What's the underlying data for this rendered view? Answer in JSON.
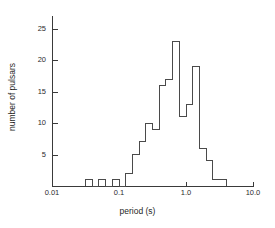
{
  "chart_data": {
    "type": "bar",
    "title": "",
    "subtitle": "",
    "xlabel": "period (s)",
    "ylabel": "number of pulsars",
    "xscale": "log",
    "yscale": "linear",
    "xlim": [
      0.01,
      10.0
    ],
    "ylim": [
      0,
      27
    ],
    "grid": false,
    "legend": null,
    "x_tick_labels": [
      "0.01",
      "0.1",
      "1.0",
      "10.0"
    ],
    "x_tick_values": [
      0.01,
      0.1,
      1.0,
      10.0
    ],
    "y_tick_labels": [
      "5",
      "10",
      "15",
      "20",
      "25"
    ],
    "y_tick_values": [
      5,
      10,
      15,
      20,
      25
    ],
    "bin_width_dex": 0.1,
    "bin_left_edges": [
      0.0316,
      0.0501,
      0.0794,
      0.1259,
      0.1585,
      0.1995,
      0.2512,
      0.3162,
      0.3981,
      0.5012,
      0.631,
      0.7943,
      1.0,
      1.2589,
      1.5849,
      1.9953,
      2.5119,
      3.1623
    ],
    "bin_right_edges": [
      0.0398,
      0.0631,
      0.1,
      0.1585,
      0.1995,
      0.2512,
      0.3162,
      0.3981,
      0.5012,
      0.631,
      0.7943,
      1.0,
      1.2589,
      1.5849,
      1.9953,
      2.5119,
      3.1623,
      3.9811
    ],
    "categories": [
      "0.032-0.040",
      "0.050-0.063",
      "0.079-0.100",
      "0.126-0.158",
      "0.158-0.200",
      "0.200-0.251",
      "0.251-0.316",
      "0.316-0.398",
      "0.398-0.501",
      "0.501-0.631",
      "0.631-0.794",
      "0.794-1.000",
      "1.000-1.259",
      "1.259-1.585",
      "1.585-1.995",
      "1.995-2.512",
      "2.512-3.162",
      "3.162-3.981"
    ],
    "values": [
      1,
      1,
      1,
      2,
      5,
      7,
      10,
      9,
      16,
      17,
      23,
      11,
      13,
      19,
      6,
      4,
      1,
      1
    ],
    "annotations": []
  },
  "axes": {
    "y_ticks": [
      {
        "label": "5",
        "value": 5
      },
      {
        "label": "10",
        "value": 10
      },
      {
        "label": "15",
        "value": 15
      },
      {
        "label": "20",
        "value": 20
      },
      {
        "label": "25",
        "value": 25
      }
    ],
    "x_ticks": [
      {
        "label": "0.01",
        "value": 0.01
      },
      {
        "label": "0.1",
        "value": 0.1
      },
      {
        "label": "1.0",
        "value": 1.0
      },
      {
        "label": "10.0",
        "value": 10.0
      }
    ],
    "x_title": "period (s)",
    "y_title": "number of pulsars"
  },
  "style": {
    "line_color": "#4a4a4a",
    "axis_color": "#3a3a3a",
    "text_color": "#2b2b2b",
    "background": "#ffffff"
  }
}
